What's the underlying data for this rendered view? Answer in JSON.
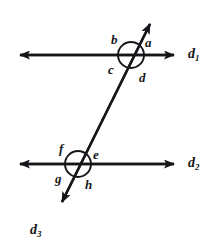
{
  "figure": {
    "background_color": "#ffffff",
    "stroke_color": "#17151a"
  },
  "lines": [
    {
      "id": "d1",
      "name": "upper-parallel-line",
      "label": "d",
      "subscript": "1",
      "orientation": "horizontal",
      "arrowheads": "both",
      "y": 55,
      "x_start": 8,
      "x_end": 182
    },
    {
      "id": "d2",
      "name": "lower-parallel-line",
      "label": "d",
      "subscript": "2",
      "orientation": "horizontal",
      "arrowheads": "both",
      "y": 164,
      "x_start": 8,
      "x_end": 182
    },
    {
      "id": "d3",
      "name": "transversal-line",
      "label": "d",
      "subscript": "3",
      "orientation": "oblique",
      "arrowheads": "both",
      "x_top": 155,
      "y_top": 14,
      "x_bottom": 52,
      "y_bottom": 222
    }
  ],
  "intersections": [
    {
      "id": "upper",
      "name": "upper-intersection",
      "cx": 131,
      "cy": 55,
      "r": 13,
      "angles": [
        {
          "key": "b",
          "label": "b",
          "position": "upper-left",
          "x": 111,
          "y": 33
        },
        {
          "key": "a",
          "label": "a",
          "position": "upper-right",
          "x": 145,
          "y": 36
        },
        {
          "key": "c",
          "label": "c",
          "position": "lower-left",
          "x": 108,
          "y": 63
        },
        {
          "key": "d",
          "label": "d",
          "position": "lower-right",
          "x": 139,
          "y": 71
        }
      ]
    },
    {
      "id": "lower",
      "name": "lower-intersection",
      "cx": 78,
      "cy": 164,
      "r": 13,
      "angles": [
        {
          "key": "f",
          "label": "f",
          "position": "upper-left",
          "x": 59,
          "y": 142
        },
        {
          "key": "e",
          "label": "e",
          "position": "upper-right",
          "x": 93,
          "y": 148
        },
        {
          "key": "g",
          "label": "g",
          "position": "lower-left",
          "x": 55,
          "y": 172
        },
        {
          "key": "h",
          "label": "h",
          "position": "lower-right",
          "x": 85,
          "y": 178
        }
      ]
    }
  ],
  "line_labels": [
    {
      "key": "d1",
      "label": "d",
      "subscript": "1",
      "x": 188,
      "y": 48
    },
    {
      "key": "d2",
      "label": "d",
      "subscript": "2",
      "x": 188,
      "y": 157
    },
    {
      "key": "d3",
      "label": "d",
      "subscript": "3",
      "x": 30,
      "y": 224
    }
  ]
}
